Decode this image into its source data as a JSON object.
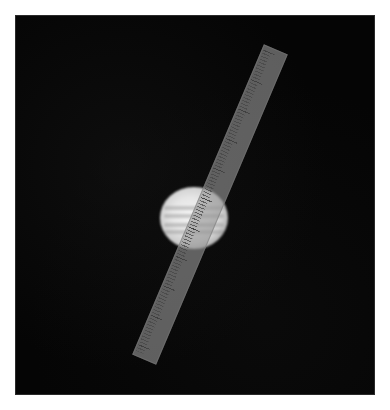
{
  "image": {
    "subject": "Planet (Jupiter-like disc) with semi-transparent ruler overlay",
    "background_color": "#050505",
    "frame": {
      "x": 16,
      "y": 16,
      "width": 358,
      "height": 378
    },
    "planet": {
      "center_x": 194,
      "center_y": 219,
      "radius_x": 34,
      "radius_y": 31,
      "color": "#e6e6e6"
    },
    "ruler": {
      "center_x": 210,
      "center_y": 205,
      "length": 337,
      "width": 26,
      "rotation_deg": 23,
      "color": "#969696",
      "labels": [
        "",
        "",
        "",
        "",
        "",
        "",
        "",
        "",
        "",
        "",
        ""
      ]
    }
  }
}
